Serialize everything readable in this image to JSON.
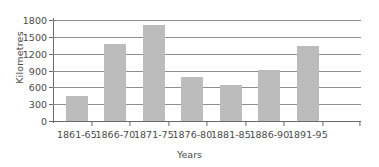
{
  "chart_data": {
    "type": "bar",
    "title": "",
    "xlabel": "Years",
    "ylabel": "Kilometres",
    "categories": [
      "1861-65",
      "1866-70",
      "1871-75",
      "1876-80",
      "1881-85",
      "1886-90",
      "1891-95"
    ],
    "values": [
      450,
      1380,
      1720,
      780,
      640,
      910,
      1330
    ],
    "ylim": [
      0,
      1800
    ],
    "yticks": [
      0,
      300,
      600,
      900,
      1200,
      1500,
      1800
    ],
    "ytick_labels": [
      "0",
      "300",
      "600",
      "900",
      "1200",
      "1500",
      "1800"
    ],
    "grid": true,
    "legend": "none",
    "bar_color": "#bcbcbc",
    "axis_color": "#6a6a6a",
    "text_color": "#4a4a4a",
    "background_color": "#ffffff"
  }
}
